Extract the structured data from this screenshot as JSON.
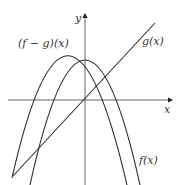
{
  "figure": {
    "axes": {
      "x_label": "x",
      "y_label": "y"
    },
    "curves": [
      {
        "id": "f_minus_g",
        "label": "(f − g)(x)",
        "type": "parabola-downward",
        "vertex": "left of y-axis, above x-axis"
      },
      {
        "id": "f",
        "label": "f(x)",
        "type": "parabola-downward",
        "vertex": "on y-axis, above x-axis"
      },
      {
        "id": "g",
        "label": "g(x)",
        "type": "line",
        "passes_through": "origin",
        "slope": "positive"
      }
    ],
    "colors": {
      "curve": "#2a2a2a",
      "axis": "#555555",
      "background": "#ffffff"
    }
  }
}
